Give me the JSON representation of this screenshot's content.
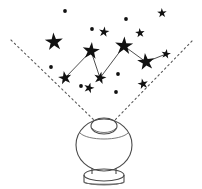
{
  "scene": {
    "title": "Star projector casting a constellation",
    "width": 202,
    "height": 189,
    "background_color": "#ffffff",
    "ink_color": "#111111",
    "line_color": "#3b3b3b",
    "beam_color": "#5a5a5a",
    "globe_color": "#4a4a4a"
  },
  "chart_data": {
    "type": "scatter",
    "xlabel": "",
    "ylabel": "",
    "xlim": [
      0,
      202
    ],
    "ylim": [
      0,
      189
    ],
    "grid": false,
    "legend": "none",
    "series": [
      {
        "name": "bright-stars",
        "marker": "5-point-star",
        "points": [
          {
            "id": "s1",
            "x": 54,
            "y": 42,
            "size": 9.5
          },
          {
            "id": "s2",
            "x": 91,
            "y": 51,
            "size": 9.0
          },
          {
            "id": "s3",
            "x": 65,
            "y": 78,
            "size": 7.0
          },
          {
            "id": "s4",
            "x": 100,
            "y": 78,
            "size": 6.5
          },
          {
            "id": "s5",
            "x": 124,
            "y": 46,
            "size": 9.5
          },
          {
            "id": "s6",
            "x": 146,
            "y": 62,
            "size": 9.0
          },
          {
            "id": "s7",
            "x": 89,
            "y": 88,
            "size": 5.5
          },
          {
            "id": "s8",
            "x": 143,
            "y": 84,
            "size": 5.5
          },
          {
            "id": "s9",
            "x": 104,
            "y": 32,
            "size": 5.5
          },
          {
            "id": "s10",
            "x": 140,
            "y": 33,
            "size": 5.0
          },
          {
            "id": "s11",
            "x": 166,
            "y": 54,
            "size": 5.0
          },
          {
            "id": "s12",
            "x": 162,
            "y": 13,
            "size": 5.0
          }
        ]
      },
      {
        "name": "faint-stars",
        "marker": "dot",
        "points": [
          {
            "id": "d1",
            "x": 65,
            "y": 11,
            "size": 2.0
          },
          {
            "id": "d2",
            "x": 92,
            "y": 29,
            "size": 2.0
          },
          {
            "id": "d3",
            "x": 126,
            "y": 19,
            "size": 2.0
          },
          {
            "id": "d4",
            "x": 51,
            "y": 67,
            "size": 2.0
          },
          {
            "id": "d5",
            "x": 81,
            "y": 86,
            "size": 2.0
          },
          {
            "id": "d6",
            "x": 118,
            "y": 74,
            "size": 2.0
          },
          {
            "id": "d7",
            "x": 116,
            "y": 92,
            "size": 2.0
          }
        ]
      }
    ],
    "links": [
      {
        "from": "s3",
        "to": "s2"
      },
      {
        "from": "s2",
        "to": "s4"
      },
      {
        "from": "s4",
        "to": "s5"
      },
      {
        "from": "s5",
        "to": "s6"
      },
      {
        "from": "s6",
        "to": "s11"
      }
    ],
    "beams": [
      {
        "name": "left-beam",
        "x1": 11,
        "y1": 40,
        "x2": 94,
        "y2": 120,
        "style": "dashed"
      },
      {
        "name": "right-beam",
        "x1": 192,
        "y1": 41,
        "x2": 114,
        "y2": 121,
        "style": "dashed"
      }
    ]
  },
  "projector": {
    "name": "star-projector-globe",
    "parts": [
      {
        "name": "globe-body",
        "label": "Sphere"
      },
      {
        "name": "globe-cap",
        "label": "Top aperture"
      },
      {
        "name": "globe-seam",
        "label": "Seam"
      },
      {
        "name": "globe-base",
        "label": "Base"
      }
    ]
  }
}
